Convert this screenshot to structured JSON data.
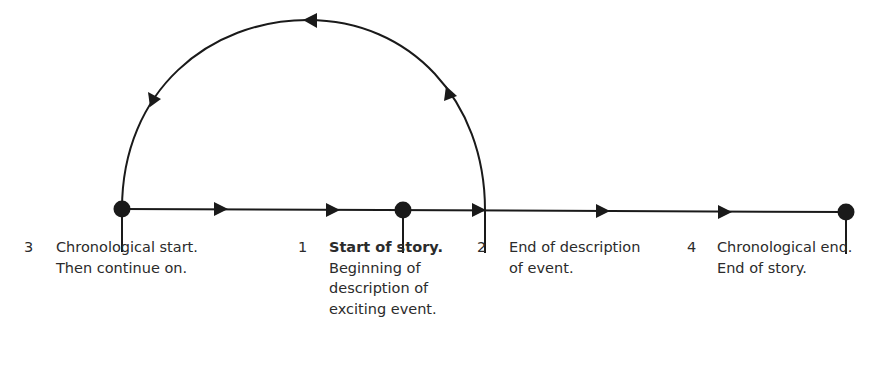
{
  "diagram": {
    "stroke_color": "#1a1a1a",
    "nodes": [
      {
        "id": "n3",
        "x": 122,
        "y": 209
      },
      {
        "id": "n1",
        "x": 403,
        "y": 210
      },
      {
        "id": "n4",
        "x": 846,
        "y": 212
      }
    ],
    "labels": [
      {
        "number": "3",
        "lines": [
          "Chronological start.",
          "Then continue on."
        ],
        "bold_first_line": false
      },
      {
        "number": "1",
        "lines": [
          "Start of story.",
          "Beginning of",
          "description of",
          "exciting event."
        ],
        "bold_first_line": true
      },
      {
        "number": "2",
        "lines": [
          "End of description",
          "of event."
        ],
        "bold_first_line": false
      },
      {
        "number": "4",
        "lines": [
          "Chronological end.",
          "End of story."
        ],
        "bold_first_line": false
      }
    ]
  }
}
